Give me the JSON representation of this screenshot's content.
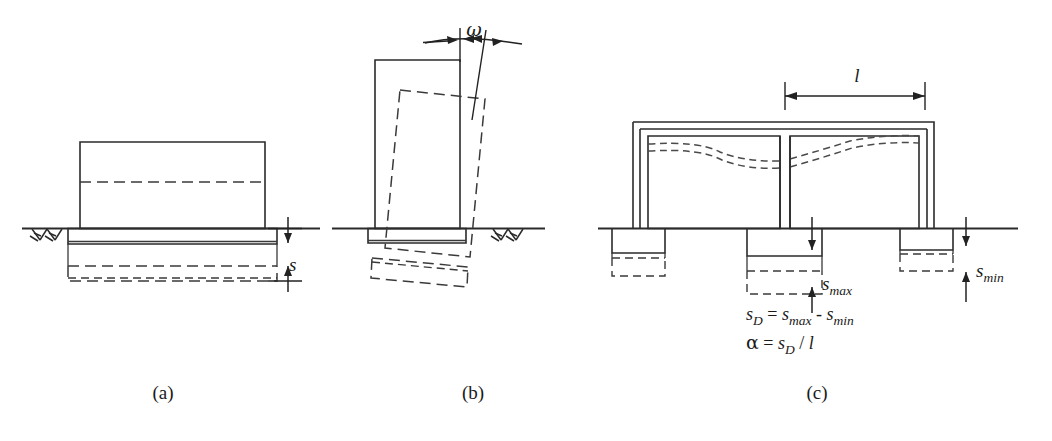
{
  "figure": {
    "background_color": "#ffffff",
    "line_color": "#2b2b2b",
    "dashed_color": "#3a3a3a",
    "width": 1052,
    "height": 441
  },
  "panels": [
    {
      "id": "a",
      "label": "(a)",
      "caption_x": 163,
      "caption_y": 399,
      "description": "Uniform settlement of a single footing",
      "dimension": {
        "symbol": "s",
        "name": "uniform-settlement",
        "label_x": 289,
        "label_y": 271
      },
      "ground_symbol": "hatch-ground"
    },
    {
      "id": "b",
      "label": "(b)",
      "caption_x": 473,
      "caption_y": 399,
      "description": "Rigid body tilt / rotation of a building",
      "dimension": {
        "symbol": "ω",
        "name": "tilt-angle",
        "label_x": 474,
        "label_y": 36
      },
      "ground_symbol": "hatch-ground"
    },
    {
      "id": "c",
      "label": "(c)",
      "caption_x": 817,
      "caption_y": 399,
      "description": "Differential settlement of a multi-bay frame",
      "dimensions": [
        {
          "symbol": "l",
          "name": "bay-length",
          "label_x": 860,
          "label_y": 72
        },
        {
          "symbol": "s",
          "sub": "max",
          "name": "max-settlement",
          "label_x": 828,
          "label_y": 290
        },
        {
          "symbol": "s",
          "sub": "min",
          "name": "min-settlement",
          "label_x": 950,
          "label_y": 277
        }
      ],
      "equations": [
        {
          "name": "differential-settlement-equation",
          "parts": [
            {
              "t": "s",
              "style": "it"
            },
            {
              "t": "D",
              "style": "sub"
            },
            {
              "t": " = ",
              "style": "op"
            },
            {
              "t": "s",
              "style": "it"
            },
            {
              "t": "max",
              "style": "sub"
            },
            {
              "t": " - ",
              "style": "op"
            },
            {
              "t": "s",
              "style": "it"
            },
            {
              "t": "min",
              "style": "sub"
            }
          ],
          "plain": "s_D = s_max - s_min",
          "x": 746,
          "y": 320
        },
        {
          "name": "angular-distortion-equation",
          "parts": [
            {
              "t": "α",
              "style": "greek"
            },
            {
              "t": " = ",
              "style": "op"
            },
            {
              "t": "s",
              "style": "it"
            },
            {
              "t": "D",
              "style": "sub"
            },
            {
              "t": " / ",
              "style": "op"
            },
            {
              "t": "l",
              "style": "it"
            }
          ],
          "plain": "α = s_D / l",
          "x": 746,
          "y": 349
        }
      ]
    }
  ],
  "icons": {
    "ground_hatch": "hatch-ground-icon",
    "arrow_head": "arrowhead-icon",
    "dimension_arrow": "dimension-arrow-icon"
  }
}
